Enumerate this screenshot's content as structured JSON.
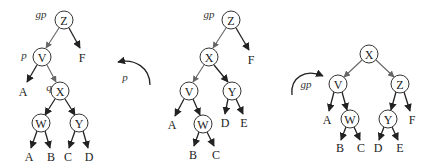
{
  "figure": {
    "node_radius": 9,
    "trees": [
      {
        "id": "before",
        "nodes": [
          {
            "key": "Z",
            "x": 64,
            "y": 20,
            "label": "gp",
            "lx": 41,
            "ly": 14
          },
          {
            "key": "V",
            "x": 42,
            "y": 57,
            "label": "p",
            "lx": 24,
            "ly": 55
          },
          {
            "key": "X",
            "x": 60,
            "y": 91,
            "label": "q",
            "lx": 49,
            "ly": 87
          },
          {
            "key": "W",
            "x": 41,
            "y": 123
          },
          {
            "key": "Y",
            "x": 79,
            "y": 123
          }
        ],
        "leaves": [
          {
            "key": "F",
            "x": 82,
            "y": 58
          },
          {
            "key": "A",
            "x": 23,
            "y": 92
          },
          {
            "key": "A",
            "x": 29,
            "y": 157
          },
          {
            "key": "B",
            "x": 51,
            "y": 157
          },
          {
            "key": "C",
            "x": 68,
            "y": 157
          },
          {
            "key": "D",
            "x": 89,
            "y": 157
          }
        ]
      },
      {
        "id": "after-first-rotation",
        "nodes": [
          {
            "key": "Z",
            "x": 231,
            "y": 20,
            "label": "gp",
            "lx": 209,
            "ly": 14
          },
          {
            "key": "X",
            "x": 209,
            "y": 57
          },
          {
            "key": "V",
            "x": 189,
            "y": 91
          },
          {
            "key": "Y",
            "x": 232,
            "y": 91
          },
          {
            "key": "W",
            "x": 203,
            "y": 124
          }
        ],
        "leaves": [
          {
            "key": "F",
            "x": 251,
            "y": 60
          },
          {
            "key": "A",
            "x": 172,
            "y": 125
          },
          {
            "key": "D",
            "x": 225,
            "y": 123
          },
          {
            "key": "E",
            "x": 244,
            "y": 123
          },
          {
            "key": "B",
            "x": 193,
            "y": 155
          },
          {
            "key": "C",
            "x": 216,
            "y": 155
          }
        ]
      },
      {
        "id": "after-second-rotation",
        "nodes": [
          {
            "key": "X",
            "x": 369,
            "y": 54
          },
          {
            "key": "V",
            "x": 338,
            "y": 84
          },
          {
            "key": "Z",
            "x": 400,
            "y": 84
          },
          {
            "key": "W",
            "x": 350,
            "y": 119
          },
          {
            "key": "Y",
            "x": 388,
            "y": 119
          }
        ],
        "leaves": [
          {
            "key": "A",
            "x": 327,
            "y": 120
          },
          {
            "key": "F",
            "x": 412,
            "y": 120
          },
          {
            "key": "B",
            "x": 340,
            "y": 148
          },
          {
            "key": "C",
            "x": 361,
            "y": 148
          },
          {
            "key": "D",
            "x": 378,
            "y": 148
          },
          {
            "key": "E",
            "x": 400,
            "y": 148
          }
        ]
      }
    ],
    "rotations": [
      {
        "label": "p",
        "label_x": 125,
        "label_y": 77,
        "direction": "counter-clockwise"
      },
      {
        "label": "gp",
        "label_x": 306,
        "label_y": 84,
        "direction": "clockwise"
      }
    ]
  }
}
